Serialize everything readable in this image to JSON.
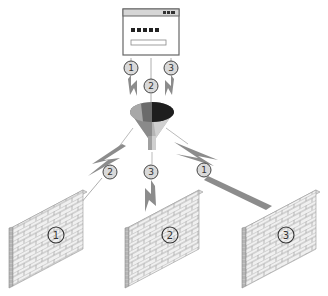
{
  "diagram": {
    "source": {
      "type": "login-window",
      "password_mask": "■■■■■",
      "title_bar_controls": "■■■"
    },
    "inbound_badges": [
      {
        "label": "1"
      },
      {
        "label": "2"
      },
      {
        "label": "3"
      }
    ],
    "filter": {
      "type": "funnel"
    },
    "outbound_badges": [
      {
        "label": "2",
        "target": "wall-1"
      },
      {
        "label": "3",
        "target": "wall-2"
      },
      {
        "label": "1",
        "target": "wall-3"
      }
    ],
    "walls": [
      {
        "label": "1"
      },
      {
        "label": "2"
      },
      {
        "label": "3"
      }
    ],
    "colors": {
      "outline": "#555555",
      "bolt": "#8c8c8c",
      "badge_fill": "#d9d9d9",
      "brick_face": "#eeeeee",
      "brick_side": "#b9b9b9",
      "funnel_dark": "#1e1e1e",
      "funnel_mid": "#6b6b6b",
      "funnel_light": "#a8a8a8"
    }
  }
}
